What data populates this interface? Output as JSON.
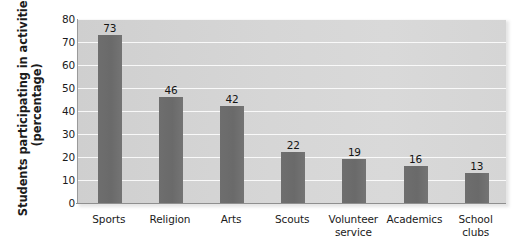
{
  "chart_data": {
    "type": "bar",
    "title": "",
    "xlabel": "",
    "ylabel": "Students participating in activities (percentage)",
    "ylabel_lines": [
      "Students participating in activities",
      "(percentage)"
    ],
    "categories": [
      "Sports",
      "Religion",
      "Arts",
      "Scouts",
      "Volunteer service",
      "Academics",
      "School clubs"
    ],
    "category_lines": [
      [
        "Sports"
      ],
      [
        "Religion"
      ],
      [
        "Arts"
      ],
      [
        "Scouts"
      ],
      [
        "Volunteer",
        "service"
      ],
      [
        "Academics"
      ],
      [
        "School",
        "clubs"
      ]
    ],
    "values": [
      73,
      46,
      42,
      22,
      19,
      16,
      13
    ],
    "ylim": [
      0,
      80
    ],
    "yticks": [
      80,
      70,
      60,
      50,
      40,
      30,
      20,
      10,
      0
    ],
    "grid": true,
    "legend": "none",
    "colors": {
      "bar": "#6b6b6b",
      "plot_background": "#d6d6d6",
      "gridline": "#ffffff",
      "axis": "#8f8f8f",
      "text": "#1b1b1b",
      "page_background": "#ffffff"
    }
  }
}
